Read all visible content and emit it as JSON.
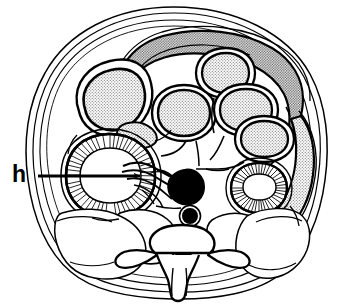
{
  "figure": {
    "type": "line-drawing",
    "background_color": "#ffffff",
    "ink_color": "#000000",
    "stipple_color": "#c9c9c9",
    "stipple_dark_color": "#9a9a9a",
    "width_px": 345,
    "height_px": 305
  },
  "labels": [
    {
      "id": "h",
      "text": "h",
      "meaning": "hilum",
      "x": 12,
      "y": 163,
      "font_size_px": 23,
      "bold": true
    }
  ],
  "leader_line": {
    "name": "arrow-to-hilum",
    "from_x": 38,
    "from_y": 176,
    "to_x": 144,
    "to_y": 176,
    "has_arrowhead": true,
    "stroke_width": 3
  },
  "structures": [
    {
      "name": "body-wall-outer",
      "kind": "outline",
      "fill": "none"
    },
    {
      "name": "body-wall-inner",
      "kind": "outline",
      "fill": "none"
    },
    {
      "name": "peritoneal-lining",
      "kind": "outline",
      "fill": "none"
    },
    {
      "name": "transverse-colon",
      "kind": "band",
      "fill": "stipple-dark"
    },
    {
      "name": "bowel-loop-left-upper",
      "kind": "loop",
      "fill": "stipple"
    },
    {
      "name": "bowel-loop-center",
      "kind": "loop",
      "fill": "stipple"
    },
    {
      "name": "bowel-loop-right-upper",
      "kind": "loop",
      "fill": "stipple"
    },
    {
      "name": "bowel-loop-right-middle",
      "kind": "loop",
      "fill": "stipple"
    },
    {
      "name": "bowel-loop-right-lower",
      "kind": "loop",
      "fill": "stipple"
    },
    {
      "name": "descending-colon-right",
      "kind": "tube",
      "fill": "stipple"
    },
    {
      "name": "adrenal-gland",
      "kind": "small-organ",
      "fill": "stipple"
    },
    {
      "name": "kidney-left",
      "kind": "kidney",
      "fill": "radiating-striations"
    },
    {
      "name": "kidney-right",
      "kind": "kidney",
      "fill": "radiating-striations"
    },
    {
      "name": "inferior-vena-cava",
      "kind": "vessel",
      "fill": "solid-black"
    },
    {
      "name": "aorta",
      "kind": "vessel",
      "fill": "solid-black"
    },
    {
      "name": "vertebral-body",
      "kind": "bone",
      "fill": "none"
    },
    {
      "name": "spinal-canal",
      "kind": "canal",
      "fill": "none"
    },
    {
      "name": "spinous-process",
      "kind": "bone",
      "fill": "none"
    },
    {
      "name": "transverse-process-left",
      "kind": "bone",
      "fill": "none"
    },
    {
      "name": "transverse-process-right",
      "kind": "bone",
      "fill": "none"
    },
    {
      "name": "psoas-muscle-left",
      "kind": "muscle",
      "fill": "none"
    },
    {
      "name": "psoas-muscle-right",
      "kind": "muscle",
      "fill": "none"
    },
    {
      "name": "paraspinal-muscle-left",
      "kind": "muscle",
      "fill": "none"
    },
    {
      "name": "paraspinal-muscle-right",
      "kind": "muscle",
      "fill": "none"
    }
  ]
}
